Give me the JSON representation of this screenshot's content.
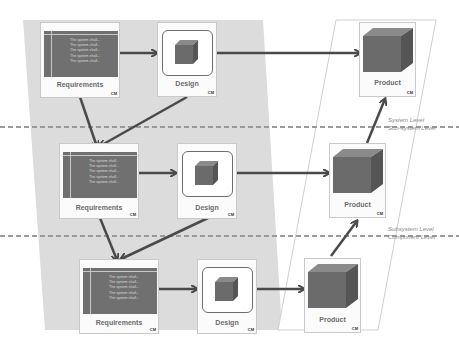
{
  "diagram": {
    "type": "v-model",
    "colors": {
      "left_band": "#dcdcdc",
      "right_band_border": "#cfcfcf",
      "arrow": "#4a4a4a",
      "cube_front": "#6b6b6b",
      "cube_top": "#8a8a8a",
      "cube_side": "#555555",
      "dashed_line": "#9a9a9a"
    },
    "levels": [
      {
        "above": "System Level",
        "below": "Sub-system Level"
      },
      {
        "above": "Subsystem Level",
        "below": "Component Level"
      }
    ],
    "rows": [
      {
        "requirements": {
          "label": "Requirements",
          "cm": "CM",
          "lines": [
            "The system shall...",
            "The system shall...",
            "The system shall...",
            "The system shall...",
            "The system shall..."
          ]
        },
        "design": {
          "label": "Design",
          "cm": "CM"
        },
        "product": {
          "label": "Product",
          "cm": "CM"
        }
      },
      {
        "requirements": {
          "label": "Requirements",
          "cm": "CM",
          "lines": [
            "The system shall...",
            "The system shall...",
            "The system shall...",
            "The system shall...",
            "The system shall..."
          ]
        },
        "design": {
          "label": "Design",
          "cm": "CM"
        },
        "product": {
          "label": "Product",
          "cm": "CM"
        }
      },
      {
        "requirements": {
          "label": "Requirements",
          "cm": "CM",
          "lines": [
            "The system shall...",
            "The system shall...",
            "The system shall...",
            "The system shall...",
            "The system shall..."
          ]
        },
        "design": {
          "label": "Design",
          "cm": "CM"
        },
        "product": {
          "label": "Product",
          "cm": "CM"
        }
      }
    ]
  }
}
